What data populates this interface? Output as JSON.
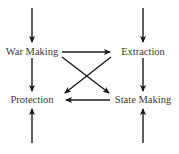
{
  "diagram": {
    "type": "flow",
    "nodes": [
      {
        "id": "war_making",
        "label": "War Making",
        "x": 32,
        "y": 52
      },
      {
        "id": "extraction",
        "label": "Extraction",
        "x": 143,
        "y": 52
      },
      {
        "id": "protection",
        "label": "Protection",
        "x": 32,
        "y": 100
      },
      {
        "id": "state_making",
        "label": "State Making",
        "x": 143,
        "y": 100
      }
    ],
    "edges": [
      {
        "from": "external_top_left",
        "to": "war_making"
      },
      {
        "from": "external_top_right",
        "to": "extraction"
      },
      {
        "from": "war_making",
        "to": "extraction"
      },
      {
        "from": "war_making",
        "to": "protection"
      },
      {
        "from": "war_making",
        "to": "state_making"
      },
      {
        "from": "extraction",
        "to": "protection"
      },
      {
        "from": "extraction",
        "to": "state_making"
      },
      {
        "from": "state_making",
        "to": "protection"
      },
      {
        "from": "external_bottom_left",
        "to": "protection"
      },
      {
        "from": "external_bottom_right",
        "to": "state_making"
      }
    ],
    "colors": {
      "arrow": "#1a1a1a",
      "text": "#3a3a3a",
      "background": "#ffffff"
    }
  }
}
